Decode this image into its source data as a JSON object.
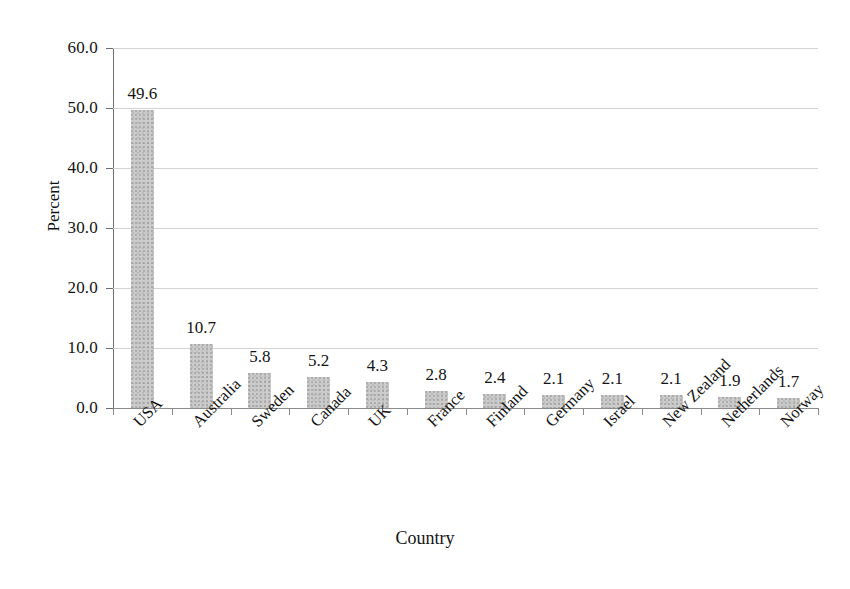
{
  "chart_data": {
    "type": "bar",
    "title": "",
    "xlabel": "Country",
    "ylabel": "Percent",
    "categories": [
      "USA",
      "Australia",
      "Sweden",
      "Canada",
      "UK",
      "France",
      "Finland",
      "Germany",
      "Israel",
      "New Zealand",
      "Netherlands",
      "Norway"
    ],
    "values": [
      49.6,
      10.7,
      5.8,
      5.2,
      4.3,
      2.8,
      2.4,
      2.1,
      2.1,
      2.1,
      1.9,
      1.7
    ],
    "value_labels": [
      "49.6",
      "10.7",
      "5.8",
      "5.2",
      "4.3",
      "2.8",
      "2.4",
      "2.1",
      "2.1",
      "2.1",
      "1.9",
      "1.7"
    ],
    "ylim": [
      0.0,
      60.0
    ],
    "ytick_values": [
      0.0,
      10.0,
      20.0,
      30.0,
      40.0,
      50.0,
      60.0
    ],
    "ytick_labels": [
      "0.0",
      "10.0",
      "20.0",
      "30.0",
      "40.0",
      "50.0",
      "60.0"
    ],
    "grid": true,
    "grid_axis": "y",
    "legend": false,
    "legend_position": "none",
    "bar_color": "#cccccc",
    "bar_texture": "stipple-noise",
    "grid_color": "#d3d3d3",
    "axis_color": "#6e6e6e",
    "text_color": "#131313",
    "background_color": "#ffffff",
    "data_labels_shown": true,
    "xtick_label_rotation": 45
  }
}
